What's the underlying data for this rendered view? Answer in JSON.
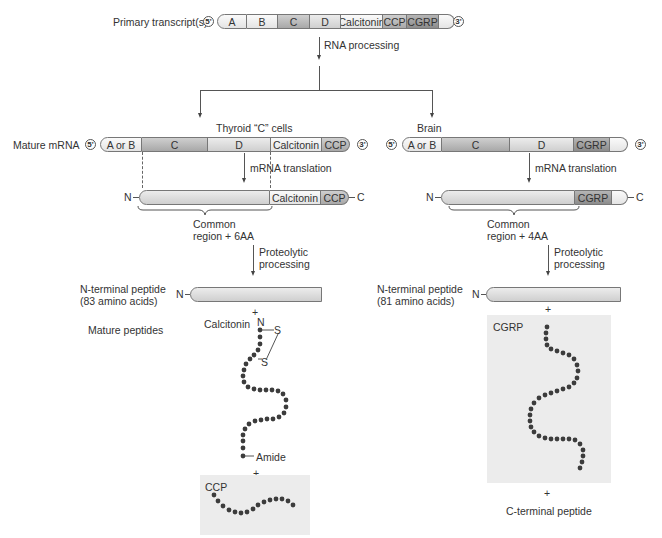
{
  "primary": {
    "label": "Primary transcript(s)",
    "five_prime": "5'",
    "three_prime": "3'",
    "segments": [
      "A",
      "B",
      "C",
      "D",
      "Calcitonin",
      "CCP",
      "CGRP",
      ""
    ]
  },
  "rna_processing": "RNA processing",
  "thyroid": {
    "title": "Thyroid “C” cells",
    "mature_label": "Mature mRNA",
    "five_prime": "5'",
    "three_prime": "3'",
    "segments": [
      "A or B",
      "C",
      "D",
      "Calcitonin",
      "CCP"
    ],
    "translation": "mRNA translation",
    "protein_n": "N",
    "protein_c": "C",
    "protein_segments": [
      "",
      "Calcitonin",
      "CCP"
    ],
    "common_region_line1": "Common",
    "common_region_line2": "region + 6AA",
    "proteolytic_line1": "Proteolytic",
    "proteolytic_line2": "processing",
    "nterm_label_line1": "N-terminal peptide",
    "nterm_label_line2": "(83 amino acids)",
    "nterm_n": "N",
    "plus1": "+",
    "mature_peptides": "Mature peptides",
    "calcitonin_label": "Calcitonin",
    "calcitonin_n": "N",
    "s1": "S",
    "s2": "S",
    "amide": "Amide",
    "plus2": "+",
    "ccp_label": "CCP"
  },
  "brain": {
    "title": "Brain",
    "five_prime": "5'",
    "three_prime": "3'",
    "segments": [
      "A or B",
      "C",
      "D",
      "CGRP",
      ""
    ],
    "translation": "mRNA translation",
    "protein_n": "N",
    "protein_c": "C",
    "protein_segments": [
      "",
      "CGRP",
      ""
    ],
    "common_region_line1": "Common",
    "common_region_line2": "region + 4AA",
    "proteolytic_line1": "Proteolytic",
    "proteolytic_line2": "processing",
    "nterm_label_line1": "N-terminal peptide",
    "nterm_label_line2": "(81 amino acids)",
    "nterm_n": "N",
    "plus1": "+",
    "cgrp_label": "CGRP",
    "plus2": "+",
    "cterm_label": "C-terminal peptide"
  }
}
